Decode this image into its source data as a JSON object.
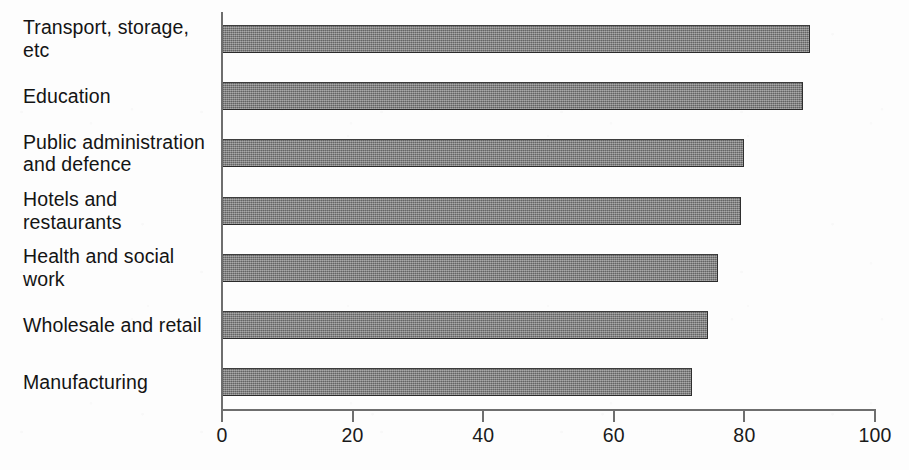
{
  "chart_data": {
    "type": "bar",
    "orientation": "horizontal",
    "title": "",
    "subtitle": "",
    "xlabel": "",
    "ylabel": "",
    "categories": [
      "Transport, storage, etc",
      "Education",
      "Public administration\nand defence",
      "Hotels and restaurants",
      "Health and social work",
      "Wholesale and retail",
      "Manufacturing"
    ],
    "values": [
      90,
      89,
      80,
      79.5,
      76,
      74.5,
      72
    ],
    "series": [
      {
        "name": "",
        "values": [
          90,
          89,
          80,
          79.5,
          76,
          74.5,
          72
        ]
      }
    ],
    "xlim": [
      0,
      100
    ],
    "ylim": null,
    "xticks": [
      0,
      20,
      40,
      60,
      80,
      100
    ],
    "xtick_labels": [
      "0",
      "20",
      "40",
      "60",
      "80",
      "100"
    ],
    "grid": false,
    "legend": false,
    "legend_position": "none",
    "bar_color": "#7b7b7b",
    "bar_edge_color": "#2f2f2f",
    "background_color": "#fdfdfd",
    "axis_color": "#6e6e6e",
    "text_color": "#141414",
    "annotations": []
  }
}
